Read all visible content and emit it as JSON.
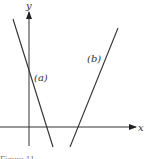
{
  "figure": {
    "axes": {
      "x_label": "x",
      "y_label": "y"
    },
    "lines": [
      {
        "label": "(a)",
        "description": "decreasing line crossing y-axis and x-axis"
      },
      {
        "label": "(b)",
        "description": "increasing line crossing x-axis right of origin"
      }
    ],
    "caption": "Figure 11"
  },
  "colors": {
    "line": "#333333",
    "background": "#ffffff"
  }
}
